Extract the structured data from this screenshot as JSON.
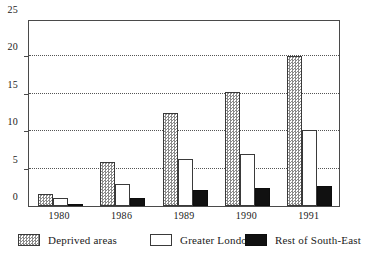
{
  "chart_data": {
    "type": "bar",
    "title": "",
    "subtitle": "",
    "xlabel": "",
    "ylabel": "",
    "categories": [
      "1980",
      "1986",
      "1989",
      "1990",
      "1991"
    ],
    "series": [
      {
        "name": "Deprived areas",
        "key": "deprived",
        "fill": "checkered",
        "values": [
          1.6,
          5.9,
          12.5,
          15.2,
          20.0
        ]
      },
      {
        "name": "Greater London",
        "key": "london",
        "fill": "white",
        "values": [
          1.1,
          3.0,
          6.3,
          7.0,
          10.2
        ]
      },
      {
        "name": "Rest of South-East",
        "key": "southeast",
        "fill": "black",
        "values": [
          0.3,
          1.1,
          2.1,
          2.4,
          2.7
        ]
      }
    ],
    "ylim": [
      0,
      25
    ],
    "yticks": [
      0,
      5,
      10,
      15,
      20,
      25
    ],
    "ytick_labels": [
      "0",
      "5",
      "10",
      "15",
      "20",
      "25"
    ],
    "grid": true,
    "grid_style": "dotted",
    "legend_position": "bottom",
    "colors": {
      "axis": "#4a4a4a",
      "grid": "#555555",
      "deprived": "#8a8a8a",
      "london": "#ffffff",
      "southeast": "#111111",
      "text": "#1a1a1a"
    }
  },
  "legend": {
    "items": [
      {
        "label": "Deprived areas"
      },
      {
        "label": "Greater London"
      },
      {
        "label": "Rest of South-East"
      }
    ]
  }
}
